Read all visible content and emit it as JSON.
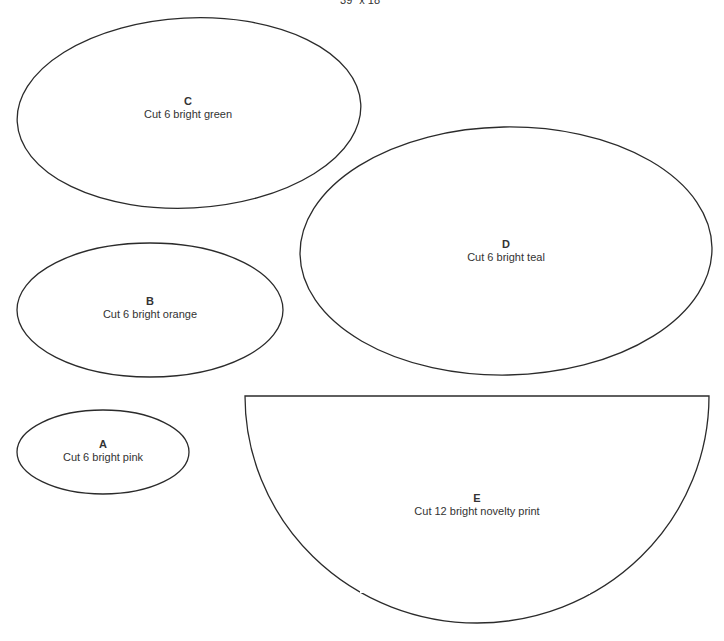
{
  "title": "39\" x 18\"",
  "stroke_color": "#2b2b2b",
  "pieces": [
    {
      "id": "A",
      "letter": "A",
      "instruction": "Cut 6 bright pink",
      "shape": "ellipse"
    },
    {
      "id": "B",
      "letter": "B",
      "instruction": "Cut 6 bright orange",
      "shape": "ellipse"
    },
    {
      "id": "C",
      "letter": "C",
      "instruction": "Cut 6 bright green",
      "shape": "ellipse"
    },
    {
      "id": "D",
      "letter": "D",
      "instruction": "Cut 6 bright teal",
      "shape": "ellipse"
    },
    {
      "id": "E",
      "letter": "E",
      "instruction": "Cut 12 bright novelty print",
      "shape": "half-ellipse"
    }
  ]
}
